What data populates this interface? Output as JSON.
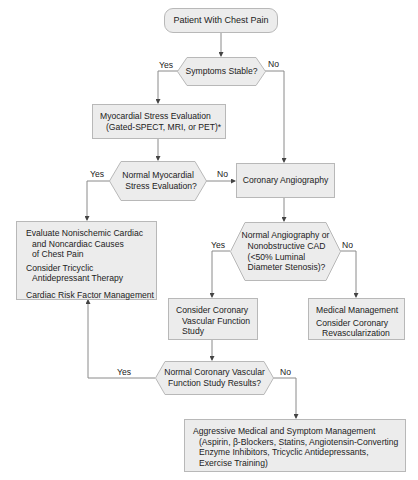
{
  "flowchart": {
    "start": {
      "label": "Patient With Chest Pain"
    },
    "decision_stable": {
      "label": "Symptoms Stable?",
      "yes": "Yes",
      "no": "No"
    },
    "stress_eval": {
      "line1": "Myocardial Stress Evaluation",
      "line2": "(Gated-SPECT, MRI, or PET)*"
    },
    "decision_normal_stress": {
      "line1": "Normal Myocardial",
      "line2": "Stress Evaluation?",
      "yes": "Yes",
      "no": "No"
    },
    "angiography": {
      "label": "Coronary Angiography"
    },
    "evaluate_box": {
      "p1_l1": "Evaluate Nonischemic Cardiac",
      "p1_l2": "and Noncardiac Causes",
      "p1_l3": "of Chest Pain",
      "p2_l1": "Consider Tricyclic",
      "p2_l2": "Antidepressant Therapy",
      "p3_l1": "Cardiac Risk Factor Management"
    },
    "decision_angio": {
      "line1": "Normal Angiography or",
      "line2": "Nonobstructive CAD",
      "line3": "(<50% Luminal",
      "line4": "Diameter Stenosis)?",
      "yes": "Yes",
      "no": "No"
    },
    "vascular_study": {
      "line1": "Consider Coronary",
      "line2": "Vascular Function",
      "line3": "Study"
    },
    "medical_mgmt": {
      "line1": "Medical Management",
      "line2": "Consider Coronary",
      "line3": "Revascularization"
    },
    "decision_vascular": {
      "line1": "Normal Coronary Vascular",
      "line2": "Function Study Results?",
      "yes": "Yes",
      "no": "No"
    },
    "aggressive_mgmt": {
      "line1": "Aggressive Medical and Symptom Management",
      "line2": "(Aspirin, β-Blockers, Statins, Angiotensin-Converting",
      "line3": "Enzyme Inhibitors, Tricyclic Antidepressants,",
      "line4": "Exercise Training)"
    },
    "colors": {
      "node_fill": "#ececec",
      "node_border": "#b8b8b8",
      "line": "#8a8a8a",
      "text": "#222222"
    }
  }
}
